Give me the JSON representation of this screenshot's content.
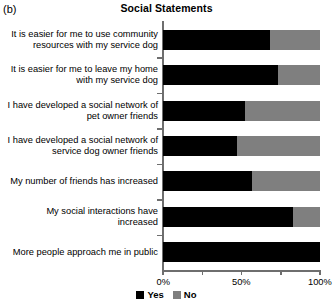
{
  "panel": {
    "label": "(b)"
  },
  "chart_data": {
    "type": "bar",
    "orientation": "horizontal",
    "stacked": true,
    "normalized_percent": true,
    "title": "Social Statements",
    "xlabel": "",
    "ylabel": "",
    "xlim": [
      0,
      100
    ],
    "grid": false,
    "legend_position": "bottom-center",
    "categories": [
      "It is easier for me to use community resources with my service dog",
      "It is easier for me to leave my home with my service dog",
      "I have developed a social network of pet owner friends",
      "I have developed a social network of service dog owner friends",
      "My number of friends has increased",
      "My social interactions have increased",
      "More people approach me in public"
    ],
    "series": [
      {
        "name": "Yes",
        "color": "#000000",
        "values": [
          68,
          73,
          52,
          47,
          57,
          83,
          100
        ]
      },
      {
        "name": "No",
        "color": "#7f7f7f",
        "values": [
          32,
          27,
          48,
          53,
          43,
          17,
          0
        ]
      }
    ],
    "xticks": [
      0,
      50,
      100
    ],
    "xticklabels": [
      "0%",
      "50%",
      "100%"
    ]
  }
}
